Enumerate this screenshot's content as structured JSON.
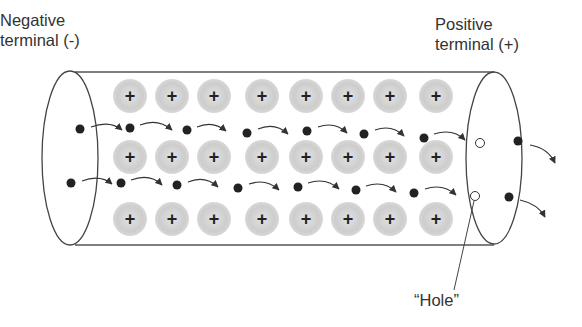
{
  "labels": {
    "negative_line1": "Negative",
    "negative_line2": "terminal (-)",
    "positive_line1": "Positive",
    "positive_line2": "terminal (+)",
    "hole": "“Hole”"
  },
  "ion": {
    "sign": "+",
    "fill_color": "#d0d0d0",
    "count_per_row": 8,
    "rows": 3
  },
  "colors": {
    "stroke": "#444444",
    "electron": "#222222",
    "ion": "#cfcfcf",
    "text": "#333333"
  }
}
